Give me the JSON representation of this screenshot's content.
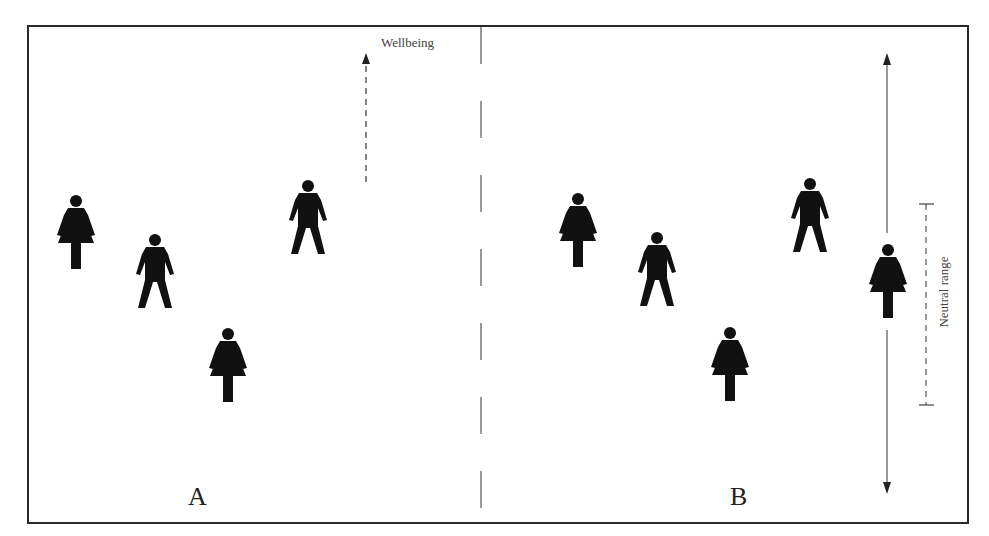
{
  "diagram": {
    "panels": [
      {
        "label": "A"
      },
      {
        "label": "B"
      }
    ],
    "annotations": {
      "wellbeing_label": "Wellbeing",
      "neutral_range_label": "Neutral range"
    },
    "figures": {
      "panel_a": [
        {
          "type": "female",
          "x": 76,
          "y": 195
        },
        {
          "type": "male",
          "x": 155,
          "y": 234
        },
        {
          "type": "female",
          "x": 228,
          "y": 328
        },
        {
          "type": "male",
          "x": 308,
          "y": 180
        }
      ],
      "panel_b": [
        {
          "type": "female",
          "x": 578,
          "y": 193
        },
        {
          "type": "male",
          "x": 657,
          "y": 232
        },
        {
          "type": "female",
          "x": 730,
          "y": 327
        },
        {
          "type": "male",
          "x": 810,
          "y": 178
        },
        {
          "type": "female",
          "x": 888,
          "y": 244
        }
      ]
    },
    "colors": {
      "figure": "#111111",
      "frame": "#2a2a2a",
      "lines": "#555555"
    }
  }
}
